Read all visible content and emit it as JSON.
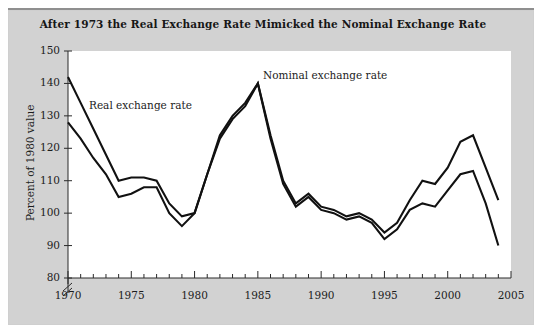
{
  "figure": {
    "title": "After 1973 the Real Exchange Rate Mimicked the Nominal Exchange Rate",
    "panel_background": "#d2d2d2",
    "plot_background": "#ffffff",
    "line_color": "#111111"
  },
  "annotations": {
    "real_label": "Real exchange rate",
    "nominal_label": "Nominal exchange rate"
  },
  "chart_data": {
    "type": "line",
    "title": "After 1973 the Real Exchange Rate Mimicked the Nominal Exchange Rate",
    "xlabel": "",
    "ylabel": "Percent of 1980 value",
    "xlim": [
      1970,
      2005
    ],
    "ylim": [
      80,
      150
    ],
    "y_axis_break_below": 80,
    "grid": false,
    "legend_position": "inline-annotations",
    "xticks": [
      1970,
      1975,
      1980,
      1985,
      1990,
      1995,
      2000,
      2005
    ],
    "xtick_labels": [
      "1970",
      "1975",
      "1980",
      "1985",
      "1990",
      "1995",
      "2000",
      "2005"
    ],
    "x_minor_tick_interval": 1,
    "yticks": [
      80,
      90,
      100,
      110,
      120,
      130,
      140,
      150
    ],
    "ytick_labels": [
      "80",
      "90",
      "100",
      "110",
      "120",
      "130",
      "140",
      "150"
    ],
    "x": [
      1970,
      1971,
      1972,
      1973,
      1974,
      1975,
      1976,
      1977,
      1978,
      1979,
      1980,
      1981,
      1982,
      1983,
      1984,
      1985,
      1986,
      1987,
      1988,
      1989,
      1990,
      1991,
      1992,
      1993,
      1994,
      1995,
      1996,
      1997,
      1998,
      1999,
      2000,
      2001,
      2002,
      2003,
      2004
    ],
    "series": [
      {
        "name": "Nominal exchange rate",
        "label": "Nominal exchange rate",
        "color": "#111111",
        "values": [
          142,
          134,
          126,
          118,
          110,
          111,
          111,
          110,
          103,
          99,
          100,
          112,
          123,
          129,
          133,
          140,
          124,
          110,
          103,
          106,
          102,
          101,
          99,
          100,
          98,
          94,
          97,
          104,
          110,
          109,
          114,
          122,
          124,
          114,
          104
        ]
      },
      {
        "name": "Real exchange rate",
        "label": "Real exchange rate",
        "color": "#111111",
        "values": [
          128,
          123,
          117,
          112,
          105,
          106,
          108,
          108,
          100,
          96,
          100,
          112,
          124,
          130,
          134,
          140,
          123,
          109,
          102,
          105,
          101,
          100,
          98,
          99,
          97,
          92,
          95,
          101,
          103,
          102,
          107,
          112,
          113,
          103,
          90
        ]
      }
    ]
  }
}
